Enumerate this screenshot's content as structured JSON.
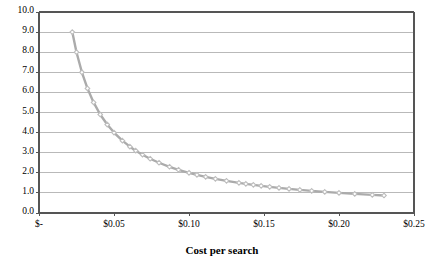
{
  "chart_data": {
    "type": "line",
    "title": "",
    "subtitle": "",
    "xlabel": "Cost per search",
    "ylabel": "",
    "xlim": [
      0,
      0.25
    ],
    "ylim": [
      0,
      10.0
    ],
    "grid": "horizontal",
    "legend": "none",
    "marker": "diamond",
    "line_color": "#ABABAB",
    "marker_color": "#BDBDBD",
    "axis_color": "#555555",
    "grid_color": "#B9B9B9",
    "xticks": [
      0,
      0.05,
      0.1,
      0.15,
      0.2,
      0.25
    ],
    "xtick_labels": [
      "$-",
      "$0.05",
      "$0.10",
      "$0.15",
      "$0.20",
      "$0.25"
    ],
    "yticks": [
      0,
      1,
      2,
      3,
      4,
      5,
      6,
      7,
      8,
      9,
      10
    ],
    "ytick_labels": [
      "0.0",
      "1.0",
      "2.0",
      "3.0",
      "4.0",
      "5.0",
      "6.0",
      "7.0",
      "8.0",
      "9.0",
      "10.0"
    ],
    "relationship": "y = 0.2 / x (hyperbolic decay)",
    "series": [
      {
        "name": "searches",
        "x": [
          0.0222,
          0.025,
          0.0286,
          0.0323,
          0.0364,
          0.0408,
          0.0455,
          0.05,
          0.0556,
          0.0606,
          0.0645,
          0.069,
          0.0741,
          0.08,
          0.087,
          0.093,
          0.1,
          0.1053,
          0.1111,
          0.1176,
          0.125,
          0.1333,
          0.1379,
          0.1429,
          0.1481,
          0.1538,
          0.16,
          0.1667,
          0.1739,
          0.1818,
          0.1905,
          0.2,
          0.2105,
          0.2222,
          0.23
        ],
        "y": [
          9.0,
          8.0,
          7.0,
          6.2,
          5.5,
          4.9,
          4.4,
          4.0,
          3.6,
          3.3,
          3.1,
          2.9,
          2.7,
          2.5,
          2.3,
          2.15,
          2.0,
          1.9,
          1.8,
          1.7,
          1.6,
          1.5,
          1.45,
          1.4,
          1.35,
          1.3,
          1.25,
          1.2,
          1.15,
          1.1,
          1.05,
          1.0,
          0.95,
          0.9,
          0.87
        ]
      }
    ]
  },
  "geometry": {
    "plot_left": 39,
    "plot_right": 414,
    "plot_top": 12,
    "plot_bottom": 213,
    "xlabel_top": 244
  }
}
